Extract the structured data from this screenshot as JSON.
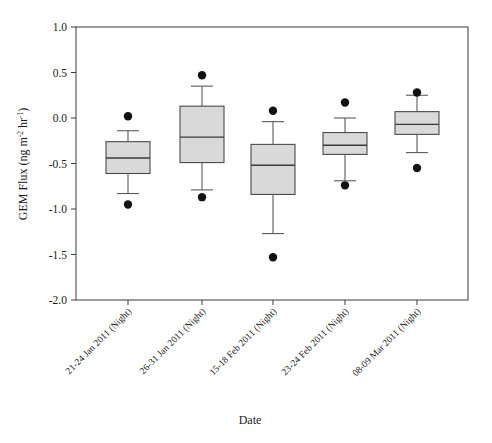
{
  "chart_data": {
    "type": "box",
    "title": "",
    "xlabel": "Date",
    "ylabel_plain": "GEM Flux (ng m-2 hr-1)",
    "ylabel_parts": {
      "lead": "GEM Flux (ng m",
      "exp1": "-2",
      "mid": " hr",
      "exp2": "-1",
      "tail": ")"
    },
    "ylim": [
      -2.0,
      1.0
    ],
    "yticks": [
      1.0,
      0.5,
      0.0,
      -0.5,
      -1.0,
      -1.5,
      -2.0
    ],
    "ytick_labels": [
      "1.0",
      "0.5",
      "0.0",
      "-0.5",
      "-1.0",
      "-1.5",
      "-2.0"
    ],
    "grid": false,
    "legend": "none",
    "categories": [
      "21-24 Jan 2011 (Night)",
      "26-31 Jan 2011 (Night)",
      "15-18 Feb 2011 (Night)",
      "23-24 Feb 2011 (Night)",
      "08-09 Mar 2011 (Night)"
    ],
    "boxes": [
      {
        "category": "21-24 Jan 2011 (Night)",
        "whisker_high": -0.14,
        "q3": -0.26,
        "median": -0.44,
        "q1": -0.61,
        "whisker_low": -0.83,
        "outliers": [
          0.02,
          -0.95
        ]
      },
      {
        "category": "26-31 Jan 2011 (Night)",
        "whisker_high": 0.35,
        "q3": 0.13,
        "median": -0.21,
        "q1": -0.49,
        "whisker_low": -0.79,
        "outliers": [
          0.47,
          -0.87
        ]
      },
      {
        "category": "15-18 Feb 2011 (Night)",
        "whisker_high": -0.04,
        "q3": -0.29,
        "median": -0.52,
        "q1": -0.84,
        "whisker_low": -1.27,
        "outliers": [
          0.08,
          -1.53
        ]
      },
      {
        "category": "23-24 Feb 2011 (Night)",
        "whisker_high": 0.0,
        "q3": -0.16,
        "median": -0.3,
        "q1": -0.4,
        "whisker_low": -0.69,
        "outliers": [
          0.17,
          -0.74
        ]
      },
      {
        "category": "08-09 Mar 2011 (Night)",
        "whisker_high": 0.25,
        "q3": 0.07,
        "median": -0.07,
        "q1": -0.18,
        "whisker_low": -0.38,
        "outliers": [
          0.28,
          -0.55
        ]
      }
    ],
    "colors": {
      "box_fill": "#d9d9d9",
      "box_edge": "#4a4a4a",
      "median": "#3a3a3a",
      "whisker": "#5a5a5a",
      "outlier": "#111111",
      "frame": "#3a3a3a",
      "background": "#ffffff"
    },
    "geometry": {
      "plot_left": 76,
      "plot_right": 468,
      "plot_top": 27,
      "plot_bottom": 300,
      "box_half_width": 22,
      "cap_half_width": 11,
      "outlier_radius": 4.2,
      "category_x": [
        128,
        202,
        273,
        345,
        417
      ]
    }
  }
}
